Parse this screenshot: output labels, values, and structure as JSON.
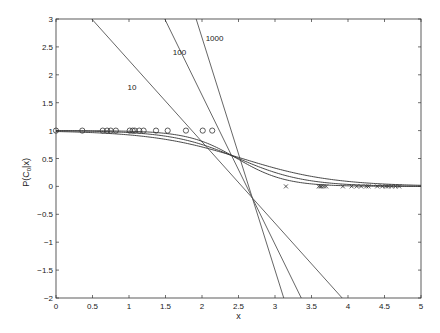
{
  "chart_data": {
    "type": "line",
    "title": "",
    "xlabel": "x",
    "ylabel": "P(C0|x)",
    "ylabel_main": "P(C",
    "ylabel_sub": "0",
    "ylabel_tail": "|x)",
    "xlim": [
      0,
      5
    ],
    "ylim": [
      -2,
      3
    ],
    "grid": false,
    "x_ticks": [
      0,
      0.5,
      1,
      1.5,
      2,
      2.5,
      3,
      3.5,
      4,
      4.5,
      5
    ],
    "x_tick_labels": [
      "0",
      "0.5",
      "1",
      "1.5",
      "2",
      "2.5",
      "3",
      "3.5",
      "4",
      "4.5",
      "5"
    ],
    "y_ticks": [
      -2,
      -1.5,
      -1,
      -0.5,
      0,
      0.5,
      1,
      1.5,
      2,
      2.5,
      3
    ],
    "y_tick_labels": [
      "-2",
      "-1.5",
      "-1",
      "-0.5",
      "0",
      "0.5",
      "1",
      "1.5",
      "2",
      "2.5",
      "3"
    ],
    "linear_fits": [
      {
        "name": "10",
        "label": "10",
        "p1": [
          0.49,
          3
        ],
        "p2": [
          3.92,
          -2
        ],
        "label_pos": [
          0.98,
          1.72
        ]
      },
      {
        "name": "100",
        "label": "100",
        "p1": [
          1.49,
          3
        ],
        "p2": [
          3.36,
          -2
        ],
        "label_pos": [
          1.6,
          2.35
        ]
      },
      {
        "name": "1000",
        "label": "1000",
        "p1": [
          1.92,
          3
        ],
        "p2": [
          3.12,
          -2
        ],
        "label_pos": [
          2.05,
          2.6
        ]
      }
    ],
    "sigmoid_curves": [
      {
        "name": "sigmoid-a",
        "k": 1.6,
        "c": 2.55
      },
      {
        "name": "sigmoid-b",
        "k": 2.2,
        "c": 2.5
      },
      {
        "name": "sigmoid-c",
        "k": 3.0,
        "c": 2.48
      }
    ],
    "series": [
      {
        "name": "class 0 samples",
        "marker": "o",
        "x": [
          0,
          0.36,
          0.64,
          0.7,
          0.75,
          0.82,
          1.01,
          1.05,
          1.08,
          1.14,
          1.2,
          1.37,
          1.53,
          1.78,
          2.01,
          2.14
        ],
        "y": [
          1,
          1,
          1,
          1,
          1,
          1,
          1,
          1,
          1,
          1,
          1,
          1,
          1,
          1,
          1,
          1
        ]
      },
      {
        "name": "class 1 samples",
        "marker": "x",
        "x": [
          3.15,
          3.6,
          3.62,
          3.64,
          3.67,
          3.7,
          3.93,
          4.05,
          4.12,
          4.18,
          4.25,
          4.28,
          4.4,
          4.47,
          4.52,
          4.55,
          4.6,
          4.65,
          4.7
        ],
        "y": [
          0,
          0,
          0,
          0,
          0,
          0,
          0,
          0,
          0,
          0,
          0,
          0,
          0,
          0,
          0,
          0,
          0,
          0,
          0
        ]
      }
    ]
  },
  "layout": {
    "plot_left": 56,
    "plot_right": 421,
    "plot_top": 19,
    "plot_bottom": 298,
    "line_color": "#555555",
    "axis_color": "#333333"
  }
}
